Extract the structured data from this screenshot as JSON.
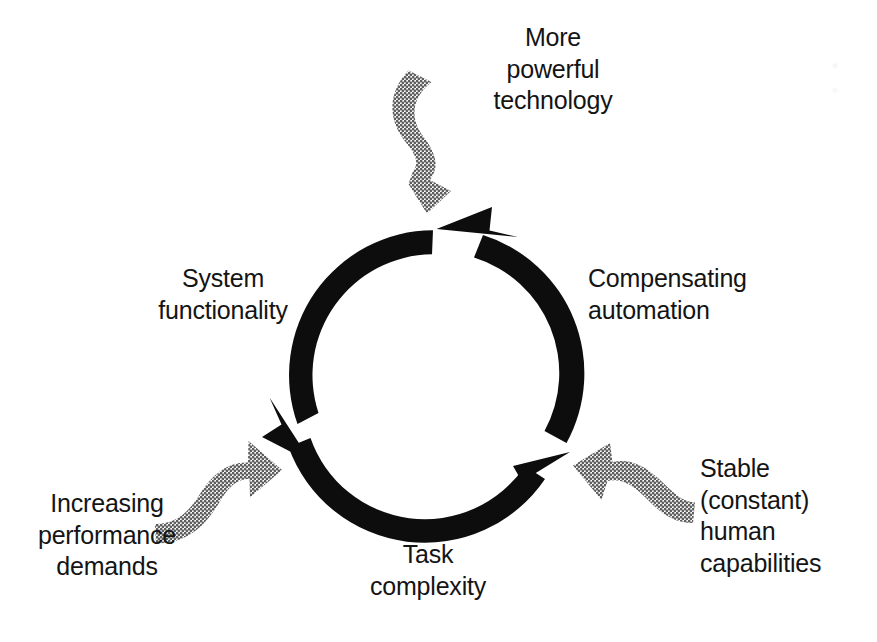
{
  "figure": {
    "kind": "cycle-diagram",
    "title_visible": false,
    "background_color": "#ffffff",
    "ring_color": "#0d0d0d",
    "feeder_color": "#808080",
    "text_color": "#141414"
  },
  "cycle": {
    "direction": "counter-clockwise",
    "center": {
      "x": 438,
      "y": 375
    },
    "radius": 145,
    "segments": [
      {
        "id": "seg-left",
        "label_key": "system_functionality",
        "from_deg": 100,
        "to_deg": 200,
        "arrow_at": "end"
      },
      {
        "id": "seg-bottom",
        "label_key": "task_complexity",
        "from_deg": 205,
        "to_deg": 310,
        "arrow_at": "end"
      },
      {
        "id": "seg-right",
        "label_key": "compensating_automation",
        "from_deg": 315,
        "to_deg": 80,
        "arrow_at": "end"
      }
    ]
  },
  "labels": {
    "system_functionality": "System\nfunctionality",
    "compensating_automation": "Compensating\nautomation",
    "task_complexity": "Task\ncomplexity",
    "more_powerful_technology": "More\npowerful\ntechnology",
    "increasing_performance_demands": "Increasing\nperformance\ndemands",
    "stable_human_capabilities": "Stable\n(constant)\nhuman\ncapabilities"
  },
  "feeder_arrows": [
    {
      "id": "feeder-top",
      "label_key": "more_powerful_technology",
      "style": "wavy-ribbon",
      "points_to": "top-of-cycle",
      "direction": "downward",
      "color": "#808080"
    },
    {
      "id": "feeder-left",
      "label_key": "increasing_performance_demands",
      "style": "wavy-ribbon",
      "points_to": "lower-left-of-cycle",
      "direction": "up-right",
      "color": "#808080"
    },
    {
      "id": "feeder-right",
      "label_key": "stable_human_capabilities",
      "style": "wavy-ribbon",
      "points_to": "lower-right-of-cycle",
      "direction": "left",
      "color": "#808080"
    }
  ]
}
